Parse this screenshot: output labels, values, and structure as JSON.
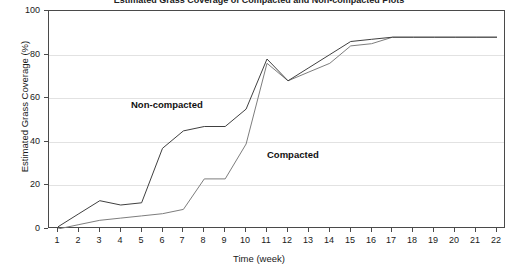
{
  "figure": {
    "clipped_title": "Estimated Grass Coverage of Compacted and Non-compacted Plots"
  },
  "chart_data": {
    "type": "line",
    "title": "",
    "xlabel": "Time (week)",
    "ylabel": "Estimated Grass Coverage (%)",
    "xlim": [
      1,
      22
    ],
    "ylim": [
      0,
      100
    ],
    "grid": true,
    "legend": "inline-annotations",
    "x": [
      1,
      2,
      3,
      4,
      5,
      6,
      7,
      8,
      9,
      10,
      11,
      12,
      13,
      14,
      15,
      16,
      17,
      18,
      19,
      20,
      21,
      22
    ],
    "xticks": [
      "1",
      "2",
      "3",
      "4",
      "5",
      "6",
      "7",
      "8",
      "9",
      "10",
      "11",
      "12",
      "13",
      "14",
      "15",
      "16",
      "17",
      "18",
      "19",
      "20",
      "21",
      "22"
    ],
    "yticks": [
      "0",
      "20",
      "40",
      "60",
      "80",
      "100"
    ],
    "series": [
      {
        "name": "Non-compacted",
        "color": "#404040",
        "values": [
          1,
          7,
          13,
          11,
          12,
          37,
          45,
          47,
          47,
          55,
          78,
          68,
          74,
          80,
          86,
          87,
          88,
          88,
          88,
          88,
          88,
          88
        ]
      },
      {
        "name": "Compacted",
        "color": "#7d7d7d",
        "values": [
          0,
          2,
          4,
          5,
          6,
          7,
          9,
          23,
          23,
          39,
          76,
          68,
          72,
          76,
          84,
          85,
          88,
          88,
          88,
          88,
          88,
          88
        ]
      }
    ],
    "annotations": [
      {
        "text": "Non-compacted",
        "x": 4.5,
        "y": 57
      },
      {
        "text": "Compacted",
        "x": 11.0,
        "y": 34
      }
    ]
  }
}
